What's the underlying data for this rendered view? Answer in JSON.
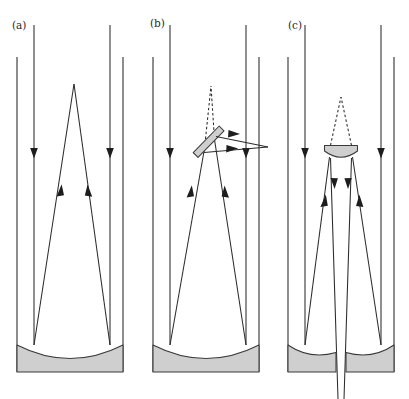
{
  "figure": {
    "width": 409,
    "height": 399,
    "background_color": "#ffffff",
    "line_color": "#2b2b2b",
    "mirror_fill_color": "#cfcfcf",
    "mirror_stroke_color": "#3a3a3a",
    "arrow_color": "#1d1d1d"
  },
  "panels": [
    {
      "id": "a",
      "label": "(a)",
      "label_x": 12,
      "label_y": 29,
      "name": "prime-focus-telescope",
      "description": "Prime focus: parallel starlight enters the tube, reflects off the concave primary mirror and converges to a focus inside the tube.",
      "elements": {
        "tube_left_wall": "vertical line",
        "tube_right_wall": "vertical line",
        "primary_mirror": "concave mirror at tube bottom",
        "focus_point": "apex inside tube"
      }
    },
    {
      "id": "b",
      "label": "(b)",
      "label_x": 150,
      "label_y": 27,
      "name": "newtonian-telescope",
      "description": "Newtonian: a flat diagonal secondary mirror intercepts the converging cone and folds the focus out through the side of the tube.",
      "elements": {
        "tube_left_wall": "vertical line",
        "tube_right_wall": "vertical line",
        "primary_mirror": "concave mirror at tube bottom",
        "secondary_mirror": "flat diagonal mirror",
        "virtual_focus": "dashed extension to original focus",
        "focus_point": "focus outside tube to the right"
      }
    },
    {
      "id": "c",
      "label": "(c)",
      "label_x": 288,
      "label_y": 29,
      "name": "cassegrain-telescope",
      "description": "Cassegrain: a convex secondary mirror reflects the converging cone back down through a central hole in the perforated primary mirror.",
      "elements": {
        "tube_left_wall": "vertical line",
        "tube_right_wall": "vertical line",
        "primary_mirror": "perforated concave mirror in two halves",
        "secondary_mirror": "convex secondary mirror",
        "virtual_focus": "dashed extension to prime focus",
        "exit_beam": "beam passing down through central hole"
      }
    }
  ],
  "geometry": {
    "a": {
      "wall_left_x": 17,
      "wall_right_x": 123,
      "wall_top_y": 57,
      "wall_bottom_y": 372,
      "incoming_left_x": 34,
      "incoming_right_x": 110,
      "incoming_top_y": 25,
      "down_arrow_y": 155,
      "apex_x": 74,
      "apex_y": 84,
      "mirror_left_x": 17,
      "mirror_right_x": 123,
      "mirror_top_y": 345,
      "mirror_sag_y": 360,
      "mirror_bottom_y": 372,
      "up_arrow_y": 186
    },
    "b": {
      "wall_left_x": 153,
      "wall_right_x": 259,
      "wall_top_y": 57,
      "wall_bottom_y": 372,
      "incoming_left_x": 170,
      "incoming_right_x": 246,
      "incoming_top_y": 25,
      "down_arrow_y": 155,
      "virtual_apex_x": 211,
      "virtual_apex_y": 86,
      "mirror_p1_x": 194,
      "mirror_p1_y": 157,
      "mirror_p2_x": 221,
      "mirror_p2_y": 128,
      "exit_focus_x": 268,
      "exit_focus_y": 147,
      "mirror_top_y": 345,
      "mirror_sag_y": 360,
      "mirror_bottom_y": 372,
      "up_arrow_y": 186
    },
    "c": {
      "wall_left_x": 288,
      "wall_right_x": 394,
      "wall_top_y": 57,
      "wall_bottom_y": 372,
      "incoming_left_x": 305,
      "incoming_right_x": 381,
      "incoming_top_y": 25,
      "down_arrow_y": 155,
      "virtual_apex_x": 341,
      "virtual_apex_y": 97,
      "secondary_left_x": 325,
      "secondary_right_x": 357,
      "secondary_top_y": 145,
      "secondary_bottom_y": 158,
      "hole_left_x": 336,
      "hole_right_x": 346,
      "mirror_top_y": 345,
      "mirror_sag_y": 360,
      "mirror_bottom_y": 372,
      "exit_bottom_y": 399,
      "up_arrow_y": 196,
      "down_arrow_inner_y": 186
    }
  }
}
